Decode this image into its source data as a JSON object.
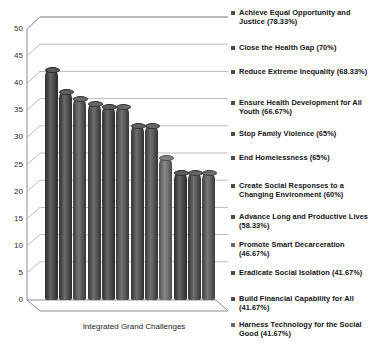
{
  "chart_data": {
    "type": "bar",
    "title": "",
    "subtitle": "",
    "xlabel": "Integrated Grand Challenges",
    "ylabel": "",
    "ylim": [
      0,
      50
    ],
    "ytick_step": 5,
    "yticks": [
      "50",
      "45",
      "40",
      "35",
      "30",
      "25",
      "20",
      "15",
      "10",
      "5",
      "0"
    ],
    "grid": true,
    "legend_position": "right",
    "style": "3d-cylinder",
    "categories": [
      "Achieve Equal Opportunity and Justice",
      "Close the Health Gap",
      "Reduce Extreme Inequality",
      "Ensure Health Development for All Youth",
      "Stop Family Violence",
      "End Homelessness",
      "Create Social Responses to a Changing Environment",
      "Advance Long and Productive Lives",
      "Promote Smart Decarceration",
      "Eradicate Social Isolation",
      "Build Financial Capability for All",
      "Harness Technology for the Social Good"
    ],
    "values": [
      47,
      42.5,
      41,
      40,
      39.5,
      39.5,
      35.5,
      35.5,
      29,
      26,
      26,
      26
    ],
    "percentages": [
      "78.33%",
      "70%",
      "68.33%",
      "66.67%",
      "65%",
      "65%",
      "60%",
      "58.33%",
      "46.67%",
      "41.67%",
      "41.67%",
      "41.67%"
    ],
    "bar_colors": [
      "#4a4a4a",
      "#4f4f4f",
      "#5a5a5a",
      "#555555",
      "#4e4e4e",
      "#595959",
      "#525252",
      "#565656",
      "#6f6f6f",
      "#4b4b4b",
      "#545454",
      "#5e5e5e"
    ]
  },
  "legend": {
    "items": [
      {
        "label": "Achieve Equal Opportunity and Justice (78.33%)",
        "marker_color": "#4d4d4d"
      },
      {
        "label": "Close the Health Gap (70%)",
        "marker_color": "#4d4d4d"
      },
      {
        "label": "Reduce Extreme Inequality (68.33%)",
        "marker_color": "#4d4d4d"
      },
      {
        "label": "Ensure Health Development for All Youth (66.67%)",
        "marker_color": "#4d4d4d"
      },
      {
        "label": "Stop Family Violence (65%)",
        "marker_color": "#4d4d4d"
      },
      {
        "label": "End Homelessness (65%)",
        "marker_color": "#4d4d4d"
      },
      {
        "label": "Create Social Responses to a Changing Environment (60%)",
        "marker_color": "#4d4d4d"
      },
      {
        "label": "Advance Long and Productive Lives (58.33%)",
        "marker_color": "#4d4d4d"
      },
      {
        "label": "Promote Smart Decarceration (46.67%)",
        "marker_color": "#6a6a6a"
      },
      {
        "label": "Eradicate Social Isolation (41.67%)",
        "marker_color": "#4d4d4d"
      },
      {
        "label": "Build Financial Capability for All (41.67%)",
        "marker_color": "#4d4d4d"
      },
      {
        "label": "Harness Technology for the Social Good (41.67%)",
        "marker_color": "#6a6a6a"
      }
    ]
  },
  "axis": {
    "x_title": "Integrated Grand Challenges"
  }
}
